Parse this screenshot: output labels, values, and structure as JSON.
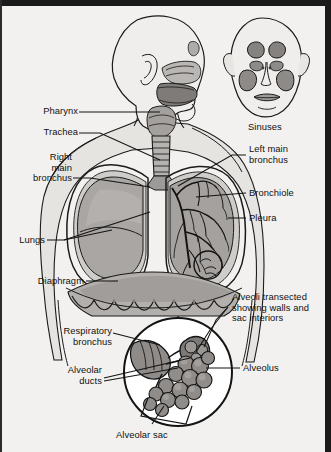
{
  "diagram": {
    "background_color": "#f2f1ef",
    "frame_color": "#1a1a1a",
    "ink_color": "#111111",
    "fill_light": "#d9d7d4",
    "fill_mid": "#b3b0ad",
    "fill_dark": "#8e8b88",
    "fill_darker": "#6f6c69"
  },
  "labels": {
    "pharynx": "Pharynx",
    "trachea": "Trachea",
    "right_main_bronchus_l1": "Right",
    "right_main_bronchus_l2": "main",
    "right_main_bronchus_l3": "bronchus",
    "lungs": "Lungs",
    "diaphragm": "Diaphragm",
    "sinuses": "Sinuses",
    "left_main_bronchus_l1": "Left main",
    "left_main_bronchus_l2": "bronchus",
    "bronchiole": "Bronchiole",
    "pleura": "Pleura",
    "alveoli_transected_l1": "Alveoli transected",
    "alveoli_transected_l2": "showing walls and",
    "alveoli_transected_l3": "sac interiors",
    "respiratory_bronchus_l1": "Respiratory",
    "respiratory_bronchus_l2": "bronchus",
    "alveolar_ducts_l1": "Alveolar",
    "alveolar_ducts_l2": "ducts",
    "alveolus": "Alveolus",
    "alveolar_sac": "Alveolar sac"
  }
}
